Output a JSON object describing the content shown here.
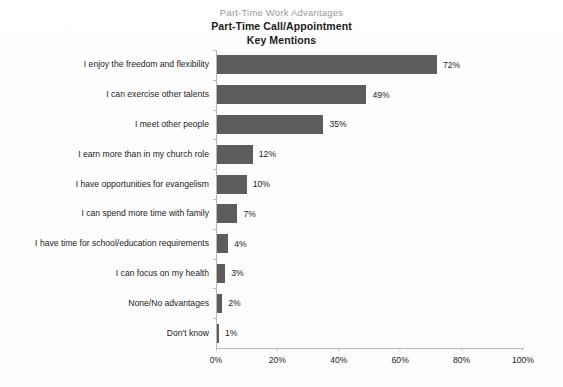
{
  "chart_data": {
    "type": "bar",
    "orientation": "horizontal",
    "supertitle": "Part-Time Work Advantages",
    "title": "Part-Time Call/Appointment",
    "subtitle": "Key Mentions",
    "xlabel": "",
    "ylabel": "",
    "xlim": [
      0,
      100
    ],
    "xtick_labels": [
      "0%",
      "20%",
      "40%",
      "60%",
      "80%",
      "100%"
    ],
    "xtick_values": [
      0,
      20,
      40,
      60,
      80,
      100
    ],
    "grid": false,
    "legend": null,
    "bar_color": "#5d5d5d",
    "categories": [
      "I enjoy the freedom and flexibility",
      "I can exercise other talents",
      "I meet other people",
      "I earn more than in my church role",
      "I have opportunities for evangelism",
      "I can spend more time with family",
      "I have time for school/education requirements",
      "I can focus on my health",
      "None/No advantages",
      "Don't know"
    ],
    "values": [
      72,
      49,
      35,
      12,
      10,
      7,
      4,
      3,
      2,
      1
    ],
    "value_labels": [
      "72%",
      "49%",
      "35%",
      "12%",
      "10%",
      "7%",
      "4%",
      "3%",
      "2%",
      "1%"
    ]
  }
}
